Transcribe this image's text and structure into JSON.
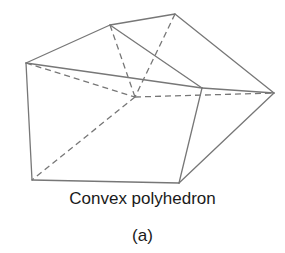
{
  "figure": {
    "caption": "Convex polyhedron",
    "sublabel": "(a)",
    "stroke_color": "#777777",
    "vertices": {
      "A": [
        26,
        63
      ],
      "B": [
        110,
        25
      ],
      "C": [
        175,
        14
      ],
      "D": [
        202,
        88
      ],
      "E": [
        274,
        93
      ],
      "F": [
        135,
        97
      ],
      "G": [
        32,
        180
      ],
      "H": [
        179,
        183
      ]
    },
    "visible_edges": [
      [
        "A",
        "B"
      ],
      [
        "B",
        "C"
      ],
      [
        "C",
        "E"
      ],
      [
        "A",
        "D"
      ],
      [
        "B",
        "D"
      ],
      [
        "D",
        "E"
      ],
      [
        "A",
        "G"
      ],
      [
        "G",
        "H"
      ],
      [
        "D",
        "H"
      ],
      [
        "H",
        "E"
      ]
    ],
    "hidden_edges": [
      [
        "A",
        "F"
      ],
      [
        "B",
        "F"
      ],
      [
        "C",
        "F"
      ],
      [
        "F",
        "E"
      ],
      [
        "F",
        "G"
      ]
    ]
  }
}
